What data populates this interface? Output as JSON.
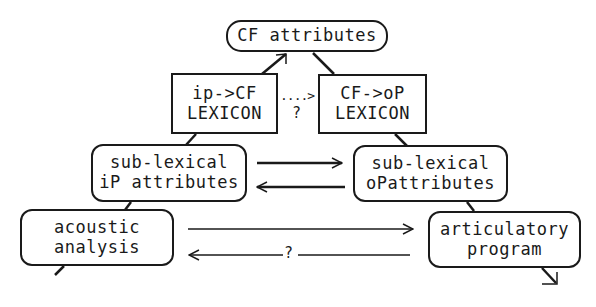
{
  "diagram": {
    "nodes": {
      "cf_attributes": {
        "line1": "CF attributes"
      },
      "ip_cf_lexicon": {
        "line1": "ip->CF",
        "line2": "LEXICON"
      },
      "cf_op_lexicon": {
        "line1": "CF->oP",
        "line2": "LEXICON"
      },
      "sublex_ip": {
        "line1": "sub-lexical",
        "line2": "iP attributes"
      },
      "sublex_op": {
        "line1": "sub-lexical",
        "line2": "oPattributes"
      },
      "acoustic": {
        "line1": "acoustic",
        "line2": "analysis"
      },
      "articulatory": {
        "line1": "articulatory",
        "line2": "program"
      }
    },
    "edges": {
      "lexicon_link_dots": "....>",
      "lexicon_link_q": "?",
      "bottom_return_q": "?"
    },
    "colors": {
      "ink": "#1a1a1a",
      "background": "#ffffff"
    }
  }
}
